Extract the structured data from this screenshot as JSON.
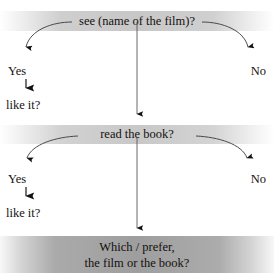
{
  "figure": {
    "type": "flowchart",
    "title_remnant": "",
    "background": "#ffffff",
    "band_fill": "#c4c4c4",
    "final_band_fill": "#9e9e9e",
    "text_color": "#161210"
  },
  "nodes": {
    "question_1": "see (name of the film)?",
    "question_2": "read the book?",
    "final_line_1": "Which / prefer,",
    "final_line_2": "the film or the book?"
  },
  "branches": {
    "yes_1": "Yes",
    "no_1": "No",
    "followup_1": "like it?",
    "yes_2": "Yes",
    "no_2": "No",
    "followup_2": "like it?"
  }
}
